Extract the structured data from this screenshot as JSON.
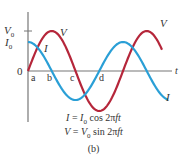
{
  "figure": {
    "caption": "(b)",
    "equations": [
      {
        "lhs": "I",
        "rhs_amp": "I",
        "rhs_sub": "0",
        "rhs_func": "cos 2π",
        "rhs_var": "ft"
      },
      {
        "lhs": "V",
        "rhs_amp": "V",
        "rhs_sub": "0",
        "rhs_func": "sin 2π",
        "rhs_var": "ft"
      }
    ],
    "axis": {
      "x_label": "t",
      "origin_label": "0",
      "y_ticks": [
        {
          "label": "V",
          "sub": "0"
        },
        {
          "label": "I",
          "sub": "0"
        }
      ],
      "points": [
        "a",
        "b",
        "c",
        "d"
      ]
    },
    "curves": [
      {
        "name": "V",
        "label": "V",
        "color": "#b5263a",
        "type": "sine"
      },
      {
        "name": "I",
        "label": "I",
        "color": "#2a9fd6",
        "type": "cosine"
      }
    ]
  }
}
